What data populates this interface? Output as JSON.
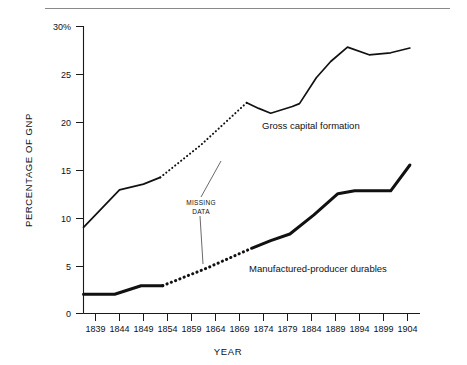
{
  "chart_data": {
    "type": "line",
    "title": "",
    "xlabel": "YEAR",
    "ylabel": "PERCENTAGE OF GNP",
    "xlim": [
      1836,
      1906
    ],
    "ylim": [
      0,
      30
    ],
    "grid": false,
    "legend_position": "inline-labels",
    "x_ticks": [
      "1839",
      "1844",
      "1849",
      "1854",
      "1859",
      "1864",
      "1869",
      "1874",
      "1879",
      "1884",
      "1889",
      "1894",
      "1899",
      "1904"
    ],
    "y_ticks": [
      "0",
      "5",
      "10",
      "15",
      "20",
      "25",
      "30%"
    ],
    "annotations": [
      {
        "text_line1": "MISSING",
        "text_line2": "DATA",
        "points_to": [
          "gross-capital-formation-gap",
          "manufactured-producer-durables-gap"
        ]
      }
    ],
    "series": [
      {
        "name": "Gross capital formation",
        "style": "thin",
        "solid_segments": [
          [
            {
              "x": 1836.5,
              "y": 9.0
            },
            {
              "x": 1844.0,
              "y": 12.9
            },
            {
              "x": 1849.0,
              "y": 13.5
            },
            {
              "x": 1852.5,
              "y": 14.2
            }
          ],
          [
            {
              "x": 1870.5,
              "y": 22.0
            },
            {
              "x": 1873.0,
              "y": 21.4
            },
            {
              "x": 1875.5,
              "y": 20.9
            },
            {
              "x": 1880.0,
              "y": 21.6
            },
            {
              "x": 1881.5,
              "y": 21.9
            },
            {
              "x": 1885.0,
              "y": 24.6
            },
            {
              "x": 1888.0,
              "y": 26.3
            },
            {
              "x": 1891.5,
              "y": 27.8
            },
            {
              "x": 1896.0,
              "y": 27.0
            },
            {
              "x": 1900.5,
              "y": 27.2
            },
            {
              "x": 1904.5,
              "y": 27.7
            }
          ]
        ],
        "dotted_segments": [
          [
            {
              "x": 1852.5,
              "y": 14.2
            },
            {
              "x": 1861.0,
              "y": 17.6
            },
            {
              "x": 1870.5,
              "y": 22.0
            }
          ]
        ]
      },
      {
        "name": "Manufactured-producer durables",
        "style": "thick",
        "solid_segments": [
          [
            {
              "x": 1836.5,
              "y": 2.0
            },
            {
              "x": 1843.0,
              "y": 2.0
            },
            {
              "x": 1848.5,
              "y": 2.9
            },
            {
              "x": 1853.0,
              "y": 2.9
            }
          ],
          [
            {
              "x": 1871.5,
              "y": 6.8
            },
            {
              "x": 1875.5,
              "y": 7.6
            },
            {
              "x": 1879.5,
              "y": 8.3
            },
            {
              "x": 1884.5,
              "y": 10.3
            },
            {
              "x": 1889.5,
              "y": 12.5
            },
            {
              "x": 1893.0,
              "y": 12.8
            },
            {
              "x": 1900.5,
              "y": 12.8
            },
            {
              "x": 1904.5,
              "y": 15.5
            }
          ]
        ],
        "dotted_segments": [
          [
            {
              "x": 1853.0,
              "y": 2.9
            },
            {
              "x": 1862.0,
              "y": 4.7
            },
            {
              "x": 1871.5,
              "y": 6.8
            }
          ]
        ]
      }
    ]
  },
  "labels": {
    "series_upper": "Gross capital formation",
    "series_lower": "Manufactured-producer durables",
    "missing_line1": "MISSING",
    "missing_line2": "DATA",
    "y_axis_title": "PERCENTAGE OF GNP",
    "x_axis_title": "YEAR",
    "y_tick_30": "30%",
    "y_tick_25": "25",
    "y_tick_20": "20",
    "y_tick_15": "15",
    "y_tick_10": "10",
    "y_tick_5": "5",
    "y_tick_0": "0",
    "x_tick_0": "1839",
    "x_tick_1": "1844",
    "x_tick_2": "1849",
    "x_tick_3": "1854",
    "x_tick_4": "1859",
    "x_tick_5": "1864",
    "x_tick_6": "1869",
    "x_tick_7": "1874",
    "x_tick_8": "1879",
    "x_tick_9": "1884",
    "x_tick_10": "1889",
    "x_tick_11": "1894",
    "x_tick_12": "1899",
    "x_tick_13": "1904"
  }
}
